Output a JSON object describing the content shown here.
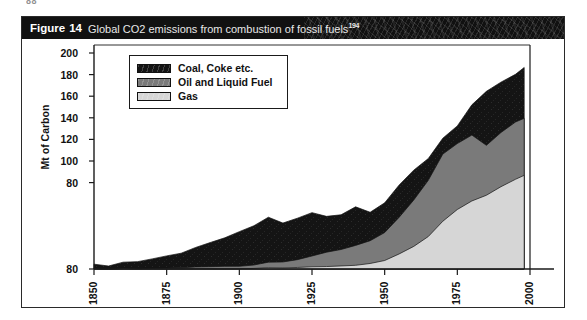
{
  "page_artifact": "88",
  "caption": {
    "figure_label": "Figure",
    "figure_number": "14",
    "text": "Global CO2 emissions from combustion of fossil fuels",
    "superscript": "194"
  },
  "legend": {
    "items": [
      {
        "label": "Coal, Coke etc.",
        "color": "#141414"
      },
      {
        "label": "Oil and Liquid Fuel",
        "color": "#7a7a7a"
      },
      {
        "label": "Gas",
        "color": "#d6d6d6"
      }
    ]
  },
  "chart_data": {
    "type": "area",
    "stacked": true,
    "title": "Global CO2 emissions from combustion of fossil fuels",
    "xlabel": "",
    "ylabel": "Mt of Carbon",
    "xlim": [
      1850,
      2000
    ],
    "ylim": [
      0,
      200
    ],
    "grid": false,
    "legend_position": "top-left",
    "xticks": [
      "1850",
      "1875",
      "1900",
      "1925",
      "1950",
      "1975",
      "2000"
    ],
    "xtick_values": [
      1850,
      1875,
      1900,
      1925,
      1950,
      1975,
      2000
    ],
    "yticks": [
      "200",
      "180",
      "160",
      "140",
      "120",
      "100",
      "80",
      "80"
    ],
    "ytick_values": [
      200,
      180,
      160,
      140,
      120,
      100,
      80,
      0
    ],
    "x": [
      1850,
      1855,
      1860,
      1865,
      1870,
      1875,
      1880,
      1885,
      1890,
      1895,
      1900,
      1905,
      1910,
      1915,
      1920,
      1925,
      1930,
      1935,
      1940,
      1945,
      1950,
      1955,
      1960,
      1965,
      1970,
      1975,
      1980,
      1985,
      1990,
      1995,
      1998
    ],
    "series": [
      {
        "name": "Gas",
        "color": "#d6d6d6",
        "values": [
          0,
          0,
          0,
          0,
          0,
          0,
          0,
          0,
          0,
          0,
          0.5,
          0.7,
          1,
          1.2,
          1.6,
          2,
          2.5,
          2.8,
          3.5,
          5,
          8,
          14,
          21,
          30,
          44,
          55,
          63,
          68,
          76,
          83,
          87
        ]
      },
      {
        "name": "Oil and Liquid Fuel",
        "color": "#7a7a7a",
        "values": [
          0,
          0,
          0.2,
          0.4,
          0.6,
          0.8,
          1.2,
          1.6,
          2,
          2.5,
          3,
          4,
          6,
          7,
          9,
          12,
          16,
          18,
          22,
          26,
          34,
          48,
          64,
          82,
          106,
          116,
          124,
          114,
          126,
          136,
          140
        ]
      },
      {
        "name": "Coal, Coke etc.",
        "color": "#141414",
        "values": [
          3,
          4,
          5,
          7,
          9,
          12,
          15,
          19,
          24,
          29,
          36,
          41,
          47,
          44,
          48,
          52,
          50,
          50,
          58,
          52,
          62,
          78,
          92,
          102,
          120,
          132,
          152,
          163,
          172,
          180,
          188
        ]
      }
    ],
    "stack_tops": {
      "gas": [
        0,
        0,
        0,
        0,
        0,
        0,
        0,
        0,
        0,
        0,
        0.5,
        0.7,
        1,
        1.2,
        1.6,
        2,
        2.5,
        2.8,
        3.5,
        5,
        8,
        14,
        21,
        30,
        44,
        55,
        63,
        68,
        76,
        83,
        87
      ],
      "oil": [
        0,
        0,
        0.2,
        0.4,
        0.6,
        0.8,
        1.2,
        1.6,
        2,
        2.5,
        3,
        4,
        6,
        7,
        9,
        12,
        16,
        18,
        22,
        26,
        34,
        48,
        64,
        82,
        106,
        116,
        124,
        114,
        126,
        136,
        140
      ],
      "coal_total": [
        3,
        4,
        5,
        7,
        9,
        12,
        15,
        19,
        24,
        29,
        36,
        41,
        47,
        44,
        48,
        52,
        50,
        50,
        58,
        52,
        62,
        78,
        92,
        102,
        120,
        132,
        152,
        163,
        172,
        180,
        188
      ]
    },
    "annotations": [
      "Total emissions rise from about 3 Mt of Carbon in 1850 to about 188 Mt of Carbon by the late 1990s.",
      "The y-axis bottom tick is printed as 80 in the scan but marks the zero baseline."
    ]
  }
}
